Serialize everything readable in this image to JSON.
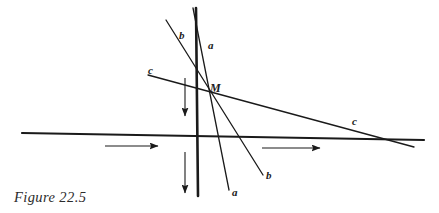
{
  "figure": {
    "caption": "Figure 22.5",
    "ink_color": "#1a1a1a",
    "background_color": "#ffffff",
    "width": 439,
    "height": 213
  },
  "labels": {
    "line_b_upper": "b",
    "line_a_upper": "a",
    "line_c_left": "c",
    "point_m": "M",
    "line_c_right": "c",
    "line_b_lower": "b",
    "line_a_lower": "a"
  },
  "geometry": {
    "point_m": {
      "x": 205,
      "y": 85
    },
    "lines": [
      {
        "name": "mirror-vertical-line",
        "x1": 196,
        "y1": 8,
        "x2": 198,
        "y2": 196,
        "width": 2.6
      },
      {
        "name": "line-a",
        "x1": 193,
        "y1": 8,
        "x2": 229,
        "y2": 190,
        "width": 1.3
      },
      {
        "name": "line-b",
        "x1": 166,
        "y1": 20,
        "x2": 263,
        "y2": 175,
        "width": 1.3
      },
      {
        "name": "line-c",
        "x1": 148,
        "y1": 75,
        "x2": 414,
        "y2": 147,
        "width": 1.3
      },
      {
        "name": "horizontal-axis",
        "x1": 22,
        "y1": 133,
        "x2": 424,
        "y2": 140,
        "width": 2.2
      }
    ],
    "arrows": [
      {
        "name": "arrow-horizontal-left",
        "x1": 105,
        "y1": 146,
        "x2": 158,
        "y2": 146
      },
      {
        "name": "arrow-horizontal-right",
        "x1": 262,
        "y1": 148,
        "x2": 320,
        "y2": 148
      },
      {
        "name": "arrow-vertical-upper",
        "x1": 185,
        "y1": 78,
        "x2": 185,
        "y2": 116
      },
      {
        "name": "arrow-vertical-lower",
        "x1": 185,
        "y1": 152,
        "x2": 185,
        "y2": 193
      }
    ]
  },
  "label_positions": {
    "line_b_upper": {
      "left": 179,
      "top": 30
    },
    "line_a_upper": {
      "left": 208,
      "top": 40
    },
    "line_c_left": {
      "left": 148,
      "top": 65
    },
    "point_m": {
      "left": 210,
      "top": 82
    },
    "line_c_right": {
      "left": 352,
      "top": 116
    },
    "line_b_lower": {
      "left": 266,
      "top": 170
    },
    "line_a_lower": {
      "left": 232,
      "top": 187
    }
  }
}
